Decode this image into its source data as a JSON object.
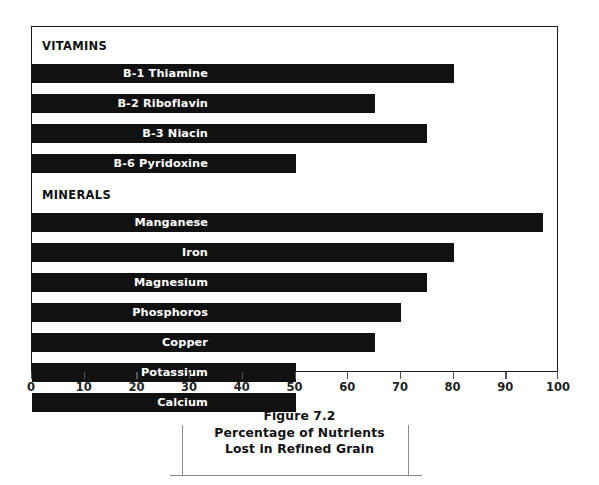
{
  "figure": {
    "caption_lines": [
      "Figure 7.2",
      "Percentage of Nutrients",
      "Lost in Refined Grain"
    ]
  },
  "sections": [
    {
      "name": "vitamins-section",
      "header": "VITAMINS"
    },
    {
      "name": "minerals-section",
      "header": "MINERALS"
    }
  ],
  "axis": {
    "ticks": [
      "0",
      "10",
      "20",
      "30",
      "40",
      "50",
      "60",
      "70",
      "80",
      "90",
      "100"
    ]
  },
  "chart_data": {
    "type": "bar",
    "orientation": "horizontal",
    "title": "Percentage of Nutrients Lost in Refined Grain",
    "subtitle": "Figure 7.2",
    "xlabel": "",
    "ylabel": "",
    "xlim": [
      0,
      100
    ],
    "xticks": [
      0,
      10,
      20,
      30,
      40,
      50,
      60,
      70,
      80,
      90,
      100
    ],
    "grid": false,
    "legend": false,
    "bar_color": "#111111",
    "label_color": "#ffffff",
    "groups": [
      {
        "name": "VITAMINS",
        "categories": [
          "B-1 Thiamine",
          "B-2 Riboflavin",
          "B-3 Niacin",
          "B-6 Pyridoxine"
        ],
        "values": [
          80,
          65,
          75,
          50
        ]
      },
      {
        "name": "MINERALS",
        "categories": [
          "Manganese",
          "Iron",
          "Magnesium",
          "Phosphoros",
          "Copper",
          "Potassium",
          "Calcium"
        ],
        "values": [
          97,
          80,
          75,
          70,
          65,
          50,
          50
        ]
      }
    ],
    "categories": [
      "B-1 Thiamine",
      "B-2 Riboflavin",
      "B-3 Niacin",
      "B-6 Pyridoxine",
      "Manganese",
      "Iron",
      "Magnesium",
      "Phosphoros",
      "Copper",
      "Potassium",
      "Calcium"
    ],
    "values": [
      80,
      65,
      75,
      50,
      97,
      80,
      75,
      70,
      65,
      50,
      50
    ]
  }
}
